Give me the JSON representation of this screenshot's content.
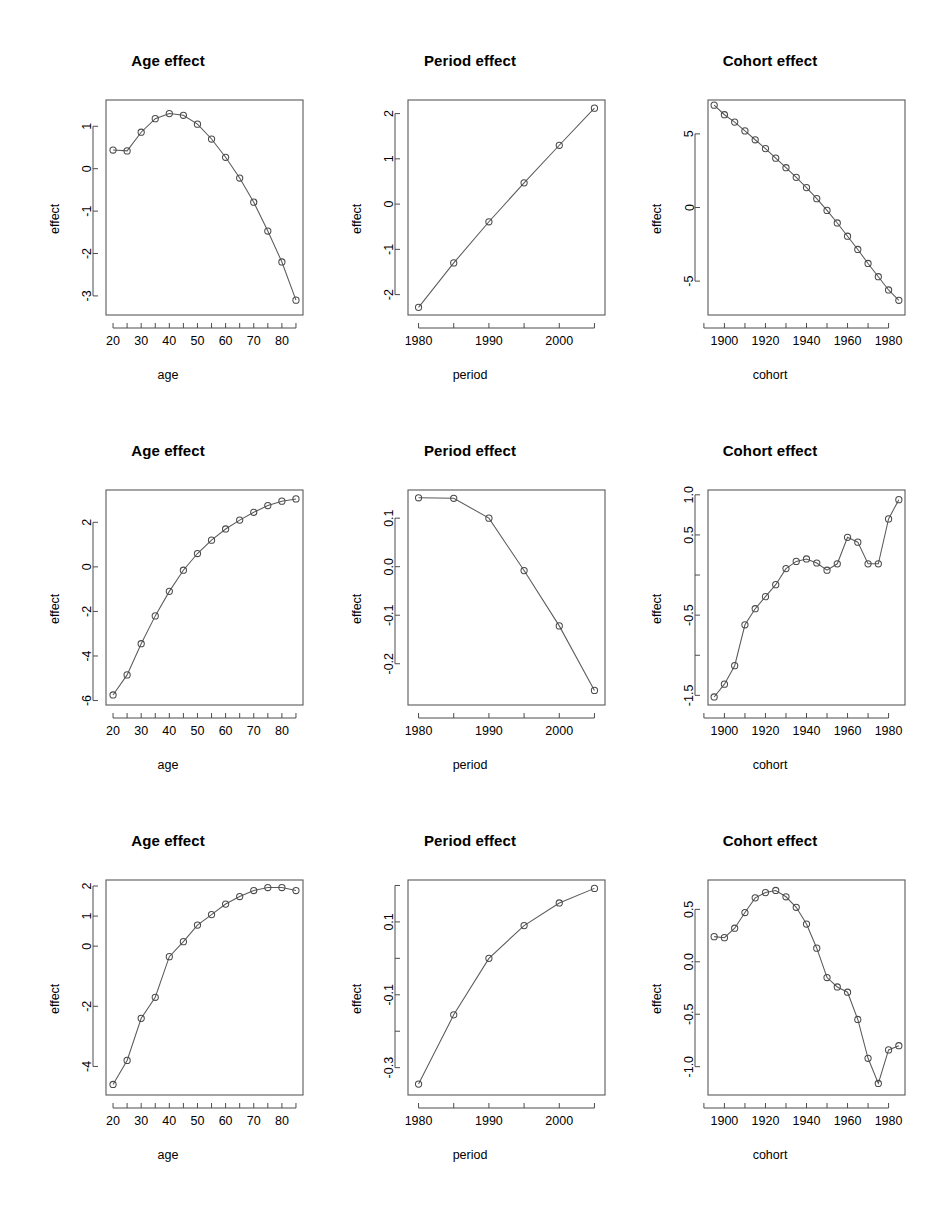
{
  "figure": {
    "rows": 3,
    "cols": 3,
    "background": "#ffffff",
    "line_color": "#5a5a5a",
    "point_color": "#4a4a4a",
    "point_symbol": "open-circle"
  },
  "chart_data": [
    {
      "panel_id": "r1c1",
      "type": "line",
      "title": "Age effect",
      "xlabel": "age",
      "ylabel": "effect",
      "x": [
        20,
        25,
        30,
        35,
        40,
        45,
        50,
        55,
        60,
        65,
        70,
        75,
        80,
        85
      ],
      "values": [
        0.44,
        0.42,
        0.86,
        1.18,
        1.3,
        1.26,
        1.05,
        0.7,
        0.27,
        -0.22,
        -0.79,
        -1.47,
        -2.2,
        -3.1
      ],
      "xticks": [
        20,
        30,
        40,
        50,
        60,
        70,
        80
      ],
      "xticklabels": [
        "20",
        "30",
        "40",
        "50",
        "60",
        "70",
        "80"
      ],
      "xminor": [
        25,
        35,
        45,
        55,
        65,
        75,
        85
      ],
      "yticks": [
        1,
        0,
        -1,
        -2,
        -3
      ],
      "yticklabels": [
        "1",
        "0",
        "-1",
        "-2",
        "-3"
      ],
      "xlim": [
        17.5,
        87.5
      ],
      "ylim": [
        -3.45,
        1.62
      ],
      "grid": false,
      "legend": "none"
    },
    {
      "panel_id": "r1c2",
      "type": "line",
      "title": "Period effect",
      "xlabel": "period",
      "ylabel": "effect",
      "x": [
        1980,
        1985,
        1990,
        1995,
        2000,
        2005
      ],
      "values": [
        -2.28,
        -1.3,
        -0.39,
        0.47,
        1.3,
        2.12
      ],
      "xticks": [
        1980,
        1990,
        2000
      ],
      "xticklabels": [
        "1980",
        "1990",
        "2000"
      ],
      "xminor": [
        1985,
        1995,
        2005
      ],
      "yticks": [
        2,
        1,
        0,
        -1,
        -2
      ],
      "yticklabels": [
        "2",
        "1",
        "0",
        "-1",
        "-2"
      ],
      "xlim": [
        1978.5,
        2006.5
      ],
      "ylim": [
        -2.45,
        2.3
      ],
      "grid": false,
      "legend": "none"
    },
    {
      "panel_id": "r1c3",
      "type": "line",
      "title": "Cohort effect",
      "xlabel": "cohort",
      "ylabel": "effect",
      "x": [
        1895,
        1900,
        1905,
        1910,
        1915,
        1920,
        1925,
        1930,
        1935,
        1940,
        1945,
        1950,
        1955,
        1960,
        1965,
        1970,
        1975,
        1980,
        1985
      ],
      "values": [
        6.95,
        6.3,
        5.8,
        5.2,
        4.6,
        4.0,
        3.35,
        2.7,
        2.05,
        1.35,
        0.6,
        -0.2,
        -1.05,
        -1.95,
        -2.85,
        -3.8,
        -4.7,
        -5.6,
        -6.3
      ],
      "xticks": [
        1900,
        1920,
        1940,
        1960,
        1980
      ],
      "xticklabels": [
        "1900",
        "1920",
        "1940",
        "1960",
        "1980"
      ],
      "xminor": [
        1890,
        1910,
        1930,
        1950,
        1970
      ],
      "yticks": [
        5,
        0,
        -5
      ],
      "yticklabels": [
        "5",
        "0",
        "-5"
      ],
      "xlim": [
        1892,
        1988
      ],
      "ylim": [
        -7.3,
        7.3
      ],
      "grid": false,
      "legend": "none"
    },
    {
      "panel_id": "r2c1",
      "type": "line",
      "title": "Age effect",
      "xlabel": "age",
      "ylabel": "effect",
      "x": [
        20,
        25,
        30,
        35,
        40,
        45,
        50,
        55,
        60,
        65,
        70,
        75,
        80,
        85
      ],
      "values": [
        -5.75,
        -4.85,
        -3.45,
        -2.2,
        -1.1,
        -0.15,
        0.6,
        1.2,
        1.7,
        2.1,
        2.45,
        2.75,
        2.95,
        3.05
      ],
      "xticks": [
        20,
        30,
        40,
        50,
        60,
        70,
        80
      ],
      "xticklabels": [
        "20",
        "30",
        "40",
        "50",
        "60",
        "70",
        "80"
      ],
      "xminor": [
        25,
        35,
        45,
        55,
        65,
        75,
        85
      ],
      "yticks": [
        2,
        0,
        -2,
        -4,
        -6
      ],
      "yticklabels": [
        "2",
        "0",
        "-2",
        "-4",
        "-6"
      ],
      "xlim": [
        17.5,
        87.5
      ],
      "ylim": [
        -6.2,
        3.45
      ],
      "grid": false,
      "legend": "none"
    },
    {
      "panel_id": "r2c2",
      "type": "line",
      "title": "Period effect",
      "xlabel": "period",
      "ylabel": "effect",
      "x": [
        1980,
        1985,
        1990,
        1995,
        2000,
        2005
      ],
      "values": [
        0.142,
        0.141,
        0.1,
        -0.008,
        -0.122,
        -0.255
      ],
      "xticks": [
        1980,
        1990,
        2000
      ],
      "xticklabels": [
        "1980",
        "1990",
        "2000"
      ],
      "xminor": [
        1985,
        1995,
        2005
      ],
      "yticks": [
        0.1,
        0.0,
        -0.1,
        -0.2
      ],
      "yticklabels": [
        "0.1",
        "0.0",
        "-0.1",
        "-0.2"
      ],
      "xlim": [
        1978.5,
        2006.5
      ],
      "ylim": [
        -0.285,
        0.158
      ],
      "grid": false,
      "legend": "none"
    },
    {
      "panel_id": "r2c3",
      "type": "line",
      "title": "Cohort effect",
      "xlabel": "cohort",
      "ylabel": "effect",
      "x": [
        1895,
        1900,
        1905,
        1910,
        1915,
        1920,
        1925,
        1930,
        1935,
        1940,
        1945,
        1950,
        1955,
        1960,
        1965,
        1970,
        1975,
        1980,
        1985
      ],
      "values": [
        -1.52,
        -1.36,
        -1.13,
        -0.62,
        -0.42,
        -0.27,
        -0.12,
        0.08,
        0.17,
        0.2,
        0.15,
        0.06,
        0.14,
        0.47,
        0.41,
        0.14,
        0.14,
        0.7,
        0.94
      ],
      "xticks": [
        1900,
        1920,
        1940,
        1960,
        1980
      ],
      "xticklabels": [
        "1900",
        "1920",
        "1940",
        "1960",
        "1980"
      ],
      "xminor": [
        1890,
        1910,
        1930,
        1950,
        1970
      ],
      "yticks": [
        1.0,
        0.5,
        0.0,
        -0.5,
        -1.0,
        -1.5
      ],
      "yticklabels": [
        "1.0",
        "0.5",
        "",
        "-0.5",
        "",
        "-1.5"
      ],
      "xlim": [
        1892,
        1988
      ],
      "ylim": [
        -1.62,
        1.06
      ],
      "grid": false,
      "legend": "none"
    },
    {
      "panel_id": "r3c1",
      "type": "line",
      "title": "Age effect",
      "xlabel": "age",
      "ylabel": "effect",
      "x": [
        20,
        25,
        30,
        35,
        40,
        45,
        50,
        55,
        60,
        65,
        70,
        75,
        80,
        85
      ],
      "values": [
        -4.6,
        -3.8,
        -2.4,
        -1.7,
        -0.35,
        0.15,
        0.7,
        1.05,
        1.4,
        1.65,
        1.85,
        1.95,
        1.95,
        1.85
      ],
      "xticks": [
        20,
        30,
        40,
        50,
        60,
        70,
        80
      ],
      "xticklabels": [
        "20",
        "30",
        "40",
        "50",
        "60",
        "70",
        "80"
      ],
      "xminor": [
        25,
        35,
        45,
        55,
        65,
        75,
        85
      ],
      "yticks": [
        2,
        1,
        0,
        -2,
        -4
      ],
      "yticklabels": [
        "2",
        "1",
        "0",
        "-2",
        "-4"
      ],
      "xlim": [
        17.5,
        87.5
      ],
      "ylim": [
        -4.95,
        2.2
      ],
      "grid": false,
      "legend": "none"
    },
    {
      "panel_id": "r3c2",
      "type": "line",
      "title": "Period effect",
      "xlabel": "period",
      "ylabel": "effect",
      "x": [
        1980,
        1985,
        1990,
        1995,
        2000,
        2005
      ],
      "values": [
        -0.345,
        -0.155,
        0.0,
        0.09,
        0.152,
        0.192
      ],
      "xticks": [
        1980,
        1990,
        2000
      ],
      "xticklabels": [
        "1980",
        "1990",
        "2000"
      ],
      "xminor": [
        1985,
        1995,
        2005
      ],
      "yticks": [
        0.1,
        -0.1,
        -0.3
      ],
      "yticklabels": [
        "0.1",
        "-0.1",
        "-0.3"
      ],
      "yminor": [
        0.2,
        0.0,
        -0.2
      ],
      "xlim": [
        1978.5,
        2006.5
      ],
      "ylim": [
        -0.375,
        0.215
      ],
      "grid": false,
      "legend": "none"
    },
    {
      "panel_id": "r3c3",
      "type": "line",
      "title": "Cohort effect",
      "xlabel": "cohort",
      "ylabel": "effect",
      "x": [
        1895,
        1900,
        1905,
        1910,
        1915,
        1920,
        1925,
        1930,
        1935,
        1940,
        1945,
        1950,
        1955,
        1960,
        1965,
        1970,
        1975,
        1980,
        1985
      ],
      "values": [
        0.24,
        0.23,
        0.32,
        0.47,
        0.61,
        0.66,
        0.68,
        0.62,
        0.52,
        0.36,
        0.13,
        -0.15,
        -0.24,
        -0.29,
        -0.55,
        -0.92,
        -1.16,
        -0.84,
        -0.8
      ],
      "xticks": [
        1900,
        1920,
        1940,
        1960,
        1980
      ],
      "xticklabels": [
        "1900",
        "1920",
        "1940",
        "1960",
        "1980"
      ],
      "xminor": [
        1890,
        1910,
        1930,
        1950,
        1970
      ],
      "yticks": [
        0.5,
        0.0,
        -0.5,
        -1.0
      ],
      "yticklabels": [
        "0.5",
        "0.0",
        "-0.5",
        "-1.0"
      ],
      "xlim": [
        1892,
        1988
      ],
      "ylim": [
        -1.27,
        0.78
      ],
      "grid": false,
      "legend": "none"
    }
  ]
}
